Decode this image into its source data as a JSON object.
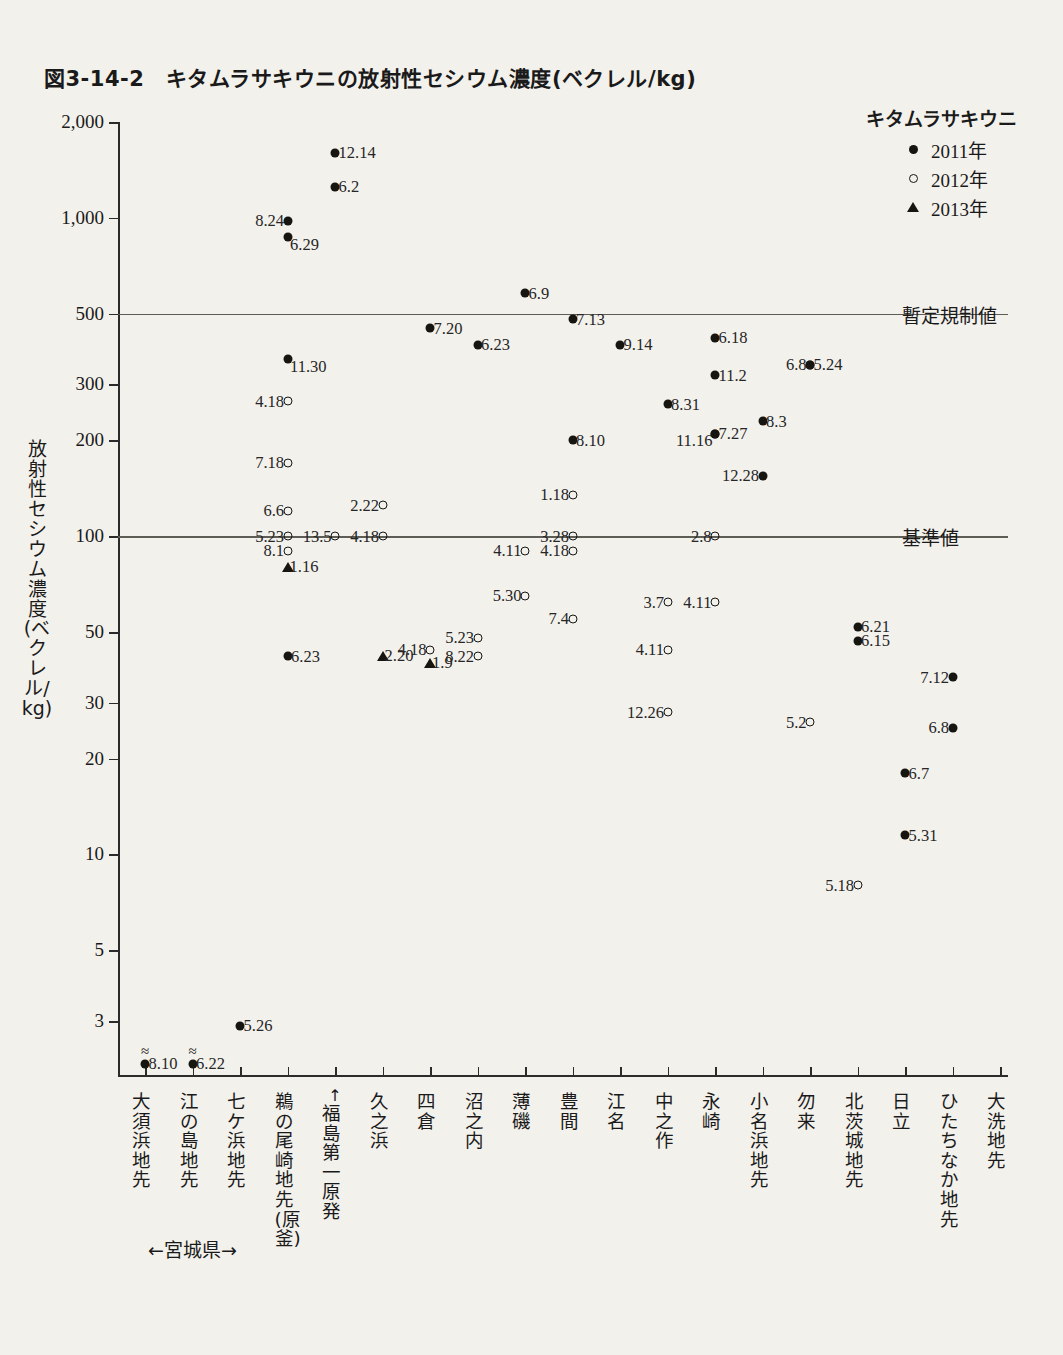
{
  "title": "図3-14-2　キタムラサキウニの放射性セシウム濃度(ベクレル/kg)",
  "legend": {
    "title": "キタムラサキウニ",
    "entries": [
      {
        "symbol": "filled-circle",
        "label": "2011年"
      },
      {
        "symbol": "open-circle",
        "label": "2012年"
      },
      {
        "symbol": "triangle",
        "label": "2013年"
      }
    ]
  },
  "annotations": {
    "fukushima": "↑福島第一原発",
    "miyagi": "←宮城県→"
  },
  "chart_data": {
    "type": "scatter",
    "title": "図3-14-2　キタムラサキウニの放射性セシウム濃度(ベクレル/kg)",
    "xlabel": "",
    "ylabel": "放射性セシウム濃度(ベクレル/kg)",
    "yscale": "log",
    "ylim": [
      2,
      2000
    ],
    "yticks": [
      2000,
      1000,
      500,
      300,
      200,
      100,
      50,
      30,
      20,
      10,
      5,
      3
    ],
    "ytick_labels": [
      "2,000",
      "1,000",
      "500",
      "300",
      "200",
      "100",
      "50",
      "30",
      "20",
      "10",
      "5",
      "3"
    ],
    "grid": false,
    "legend_position": "top-right",
    "categories": [
      "大須浜地先",
      "江の島地先",
      "七ケ浜地先",
      "鵜の尾崎地先(原釜)",
      "久之浜",
      "四倉",
      "沼之内",
      "薄磯",
      "豊間",
      "江名",
      "中之作",
      "永崎",
      "小名浜地先",
      "勿来",
      "北茨城地先",
      "日立",
      "ひたちなか地先",
      "大洗地先"
    ],
    "category_ticks": 19,
    "reference_lines": [
      {
        "value": 500,
        "label": "暫定規制値"
      },
      {
        "value": 100,
        "label": "基準値"
      }
    ],
    "series": [
      {
        "name": "2011年",
        "symbol": "filled-circle",
        "points": [
          {
            "category_index": 0,
            "value": 2.2,
            "label": "8.10",
            "label_pos": "right",
            "non_detect": true
          },
          {
            "category_index": 1,
            "value": 2.2,
            "label": "6.22",
            "label_pos": "right",
            "non_detect": true
          },
          {
            "category_index": 2,
            "value": 2.9,
            "label": "5.26",
            "label_pos": "right"
          },
          {
            "category_index": 3,
            "value": 980,
            "label": "8.24",
            "label_pos": "left"
          },
          {
            "category_index": 3,
            "value": 870,
            "label": "6.29",
            "label_pos": "bottom-right"
          },
          {
            "category_index": 3,
            "value": 360,
            "label": "11.30",
            "label_pos": "bottom-right"
          },
          {
            "category_index": 3,
            "value": 42,
            "label": "6.23",
            "label_pos": "right"
          },
          {
            "category_index": 4,
            "value": 1600,
            "label": "12.14",
            "label_pos": "right"
          },
          {
            "category_index": 4,
            "value": 1250,
            "label": "6.2",
            "label_pos": "right"
          },
          {
            "category_index": 6,
            "value": 450,
            "label": "7.20",
            "label_pos": "right"
          },
          {
            "category_index": 7,
            "value": 400,
            "label": "6.23",
            "label_pos": "right"
          },
          {
            "category_index": 8,
            "value": 580,
            "label": "6.9",
            "label_pos": "right"
          },
          {
            "category_index": 9,
            "value": 480,
            "label": "7.13",
            "label_pos": "right"
          },
          {
            "category_index": 9,
            "value": 200,
            "label": "8.10",
            "label_pos": "right"
          },
          {
            "category_index": 10,
            "value": 400,
            "label": "9.14",
            "label_pos": "right"
          },
          {
            "category_index": 11,
            "value": 260,
            "label": "8.31",
            "label_pos": "right"
          },
          {
            "category_index": 12,
            "value": 420,
            "label": "6.18",
            "label_pos": "right"
          },
          {
            "category_index": 12,
            "value": 320,
            "label": "11.2",
            "label_pos": "right"
          },
          {
            "category_index": 12,
            "value": 210,
            "label": "7.27",
            "label_pos": "right"
          },
          {
            "category_index": 12,
            "value": 210,
            "label": "11.16",
            "label_pos": "bottom-left"
          },
          {
            "category_index": 13,
            "value": 230,
            "label": "8.3",
            "label_pos": "right"
          },
          {
            "category_index": 13,
            "value": 155,
            "label": "12.28",
            "label_pos": "left"
          },
          {
            "category_index": 14,
            "value": 345,
            "label": "5.24",
            "label_pos": "right"
          },
          {
            "category_index": 14,
            "value": 345,
            "label": "6.8",
            "label_pos": "left"
          },
          {
            "category_index": 15,
            "value": 52,
            "label": "6.21",
            "label_pos": "right"
          },
          {
            "category_index": 15,
            "value": 47,
            "label": "6.15",
            "label_pos": "right"
          },
          {
            "category_index": 16,
            "value": 18,
            "label": "6.7",
            "label_pos": "right"
          },
          {
            "category_index": 16,
            "value": 11.5,
            "label": "5.31",
            "label_pos": "right"
          },
          {
            "category_index": 17,
            "value": 36,
            "label": "7.12",
            "label_pos": "left"
          },
          {
            "category_index": 17,
            "value": 25,
            "label": "6.8",
            "label_pos": "left"
          }
        ]
      },
      {
        "name": "2012年",
        "symbol": "open-circle",
        "points": [
          {
            "category_index": 3,
            "value": 265,
            "label": "4.18",
            "label_pos": "left"
          },
          {
            "category_index": 3,
            "value": 170,
            "label": "7.18",
            "label_pos": "left"
          },
          {
            "category_index": 3,
            "value": 120,
            "label": "6.6",
            "label_pos": "left"
          },
          {
            "category_index": 3,
            "value": 100,
            "label": "5.23",
            "label_pos": "left"
          },
          {
            "category_index": 3,
            "value": 90,
            "label": "8.1",
            "label_pos": "left"
          },
          {
            "category_index": 4,
            "value": 100,
            "label": "13.5",
            "label_pos": "left"
          },
          {
            "category_index": 5,
            "value": 125,
            "label": "2.22",
            "label_pos": "left"
          },
          {
            "category_index": 5,
            "value": 100,
            "label": "4.18",
            "label_pos": "left"
          },
          {
            "category_index": 6,
            "value": 44,
            "label": "4.18",
            "label_pos": "left"
          },
          {
            "category_index": 7,
            "value": 48,
            "label": "5.23",
            "label_pos": "left"
          },
          {
            "category_index": 7,
            "value": 42,
            "label": "8.22",
            "label_pos": "left"
          },
          {
            "category_index": 8,
            "value": 65,
            "label": "5.30",
            "label_pos": "left"
          },
          {
            "category_index": 8,
            "value": 90,
            "label": "4.11",
            "label_pos": "left"
          },
          {
            "category_index": 9,
            "value": 135,
            "label": "1.18",
            "label_pos": "left"
          },
          {
            "category_index": 9,
            "value": 100,
            "label": "3.28",
            "label_pos": "left"
          },
          {
            "category_index": 9,
            "value": 90,
            "label": "4.18",
            "label_pos": "left"
          },
          {
            "category_index": 9,
            "value": 55,
            "label": "7.4",
            "label_pos": "left"
          },
          {
            "category_index": 11,
            "value": 62,
            "label": "3.7",
            "label_pos": "left"
          },
          {
            "category_index": 11,
            "value": 44,
            "label": "4.11",
            "label_pos": "left"
          },
          {
            "category_index": 11,
            "value": 28,
            "label": "12.26",
            "label_pos": "left"
          },
          {
            "category_index": 12,
            "value": 100,
            "label": "2.8",
            "label_pos": "left"
          },
          {
            "category_index": 12,
            "value": 62,
            "label": "4.11",
            "label_pos": "left"
          },
          {
            "category_index": 14,
            "value": 26,
            "label": "5.2",
            "label_pos": "left"
          },
          {
            "category_index": 15,
            "value": 8,
            "label": "5.18",
            "label_pos": "left"
          }
        ]
      },
      {
        "name": "2013年",
        "symbol": "triangle",
        "points": [
          {
            "category_index": 3,
            "value": 80,
            "label": "1.16",
            "label_pos": "right"
          },
          {
            "category_index": 5,
            "value": 42,
            "label": "2.20",
            "label_pos": "right"
          },
          {
            "category_index": 6,
            "value": 40,
            "label": "1.9",
            "label_pos": "right"
          }
        ]
      }
    ]
  }
}
